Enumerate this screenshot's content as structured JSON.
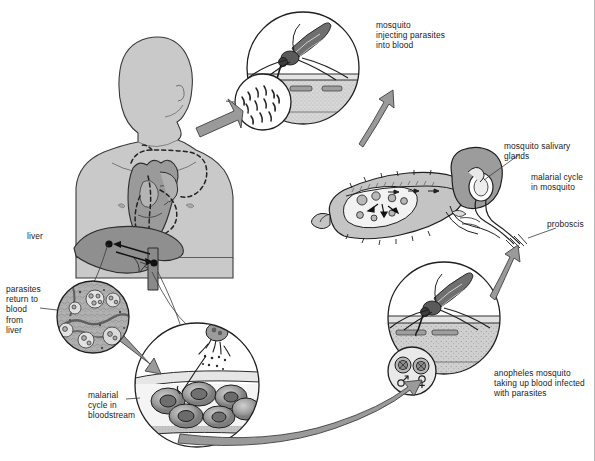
{
  "figure": {
    "background_color": "#ffffff",
    "ink_color": "#1b1b1b",
    "arrow_fill": "#9a9a9a",
    "body_fill": "#c9c9c9",
    "organ_fill": "#8f8f8f"
  },
  "labels": {
    "liver": "liver",
    "parasites_return": "parasites\nreturn to\nblood\nfrom\nliver",
    "malarial_cycle_bloodstream": "malarial\ncycle in\nbloodstream",
    "mosquito_injecting": "mosquito\ninjecting parasites\ninto blood",
    "salivary_glands": "mosquito salivary\nglands",
    "malarial_cycle_mosquito": "malarial cycle\nin mosquito",
    "proboscis": "proboscis",
    "anopheles_taking_up": "anopheles mosquito\ntaking up blood infected\nwith parasites"
  },
  "insets": {
    "sporozoites": {
      "name": "sporozoites-inset",
      "description": "sporozoites in saliva"
    },
    "gametocytes": {
      "name": "gametocytes-inset",
      "male_symbol": "♂",
      "female_symbol": "♀"
    }
  },
  "scenes": {
    "human": "human torso with heart and liver",
    "bite_top": "mosquito biting skin injecting parasites",
    "bite_bottom": "mosquito biting skin taking up blood",
    "liver_tissue": "liver tissue with parasites",
    "blood_cells": "red blood cells infected with parasites",
    "mosquito": "anopheles mosquito internal anatomy"
  }
}
